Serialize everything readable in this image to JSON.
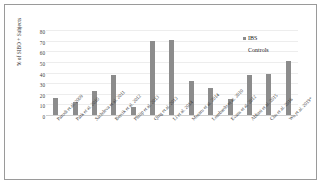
{
  "chart_data": {
    "type": "bar",
    "title": "",
    "xlabel": "",
    "ylabel": "% of SIBO + Subjects",
    "ylim": [
      0,
      80
    ],
    "ytick_labels": [
      "80",
      "70",
      "60",
      "50",
      "40",
      "30",
      "20",
      "10",
      "0"
    ],
    "ytick_values": [
      80,
      70,
      60,
      50,
      40,
      30,
      20,
      10,
      0
    ],
    "grid": true,
    "legend_position": "top-right",
    "categories": [
      "Parodi et al. 2009",
      "Park et al. 2010",
      "Sachdeva et al. 2011",
      "Bercik et al. 2012",
      "Philip et al. 2013",
      "Qing et al. 2013",
      "Li et al. 2014",
      "Moraru et al. 2014",
      "Lombardo et al. 2010",
      "Evans et al. 2012",
      "Abbasi et al. 2015",
      "Chu et al. 2016",
      "Wu et al. 2019*"
    ],
    "series": [
      {
        "name": "IBS",
        "color": "#8c8c8c",
        "values": [
          16,
          12,
          23,
          38,
          8,
          70,
          71,
          32,
          25,
          15,
          38,
          39,
          51
        ]
      },
      {
        "name": "Controls",
        "color": "#8c8c8c",
        "values": [
          null,
          null,
          null,
          null,
          null,
          null,
          null,
          null,
          null,
          null,
          null,
          null,
          null
        ]
      }
    ]
  },
  "legend": {
    "entries": [
      {
        "label": "IBS"
      },
      {
        "label": "Controls"
      }
    ]
  }
}
